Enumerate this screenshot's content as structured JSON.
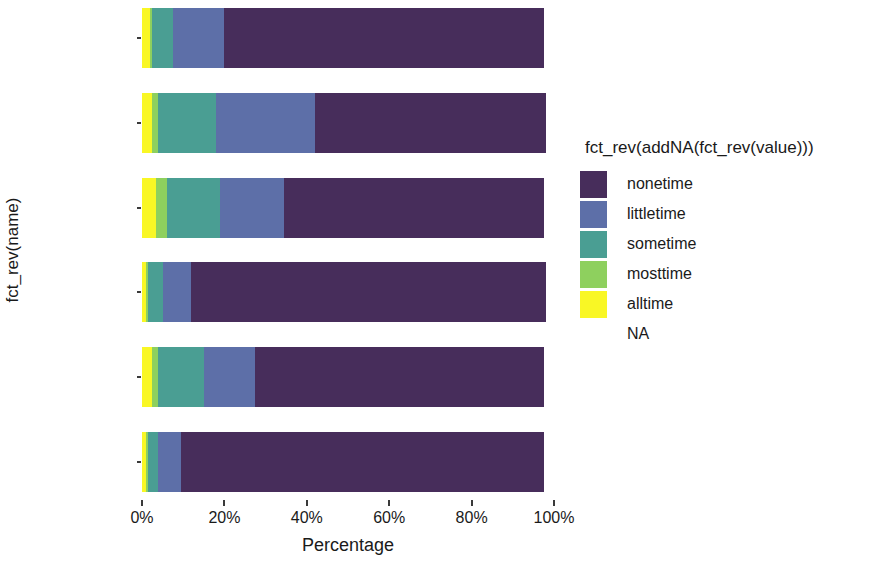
{
  "chart_data": {
    "type": "bar",
    "orientation": "horizontal",
    "stacked": true,
    "stack_mode": "percent",
    "title": "",
    "subtitle": "",
    "xlabel": "Percentage",
    "ylabel": "fct_rev(name)",
    "xlim": [
      0,
      100
    ],
    "xticks": [
      0,
      20,
      40,
      60,
      80,
      100
    ],
    "xtick_labels": [
      "0%",
      "20%",
      "40%",
      "60%",
      "80%",
      "100%"
    ],
    "grid": false,
    "legend_position": "right",
    "legend_title": "fct_rev(addNA(fct_rev(value)))",
    "categories": [
      "k6_sad",
      "k6_nervous",
      "k6_restless",
      "k6_hopeless",
      "k6_effort",
      "k6_worthless"
    ],
    "series": [
      {
        "name": "nonetime",
        "color": "#472d5b",
        "values": [
          77.5,
          56.0,
          63.0,
          86.0,
          70.0,
          88.0
        ]
      },
      {
        "name": "littletime",
        "color": "#5d6fa8",
        "values": [
          12.5,
          24.0,
          15.5,
          7.0,
          12.5,
          5.5
        ]
      },
      {
        "name": "sometime",
        "color": "#4a9e93",
        "values": [
          5.0,
          14.0,
          13.0,
          3.5,
          11.0,
          2.5
        ]
      },
      {
        "name": "mosttime",
        "color": "#8ed05e",
        "values": [
          0.5,
          1.5,
          2.5,
          0.5,
          1.5,
          0.5
        ]
      },
      {
        "name": "alltime",
        "color": "#f9f725",
        "values": [
          2.0,
          2.5,
          3.5,
          1.0,
          2.5,
          1.0
        ]
      },
      {
        "name": "NA",
        "color": "#ffffff",
        "values": [
          2.5,
          2.0,
          2.5,
          2.0,
          2.5,
          2.5
        ]
      }
    ],
    "stack_order_left_to_right": [
      "alltime",
      "mosttime",
      "sometime",
      "littletime",
      "nonetime",
      "NA"
    ]
  },
  "legend": {
    "title": "fct_rev(addNA(fct_rev(value)))",
    "items": [
      {
        "label": "nonetime",
        "color": "#472d5b"
      },
      {
        "label": "littletime",
        "color": "#5d6fa8"
      },
      {
        "label": "sometime",
        "color": "#4a9e93"
      },
      {
        "label": "mosttime",
        "color": "#8ed05e"
      },
      {
        "label": "alltime",
        "color": "#f9f725"
      },
      {
        "label": "NA",
        "color": "#ffffff"
      }
    ]
  },
  "axes": {
    "x_title": "Percentage",
    "y_title": "fct_rev(name)",
    "x_tick_labels": [
      "0%",
      "20%",
      "40%",
      "60%",
      "80%",
      "100%"
    ],
    "y_tick_labels": [
      "k6_sad",
      "k6_nervous",
      "k6_restless",
      "k6_hopeless",
      "k6_effort",
      "k6_worthless"
    ]
  }
}
